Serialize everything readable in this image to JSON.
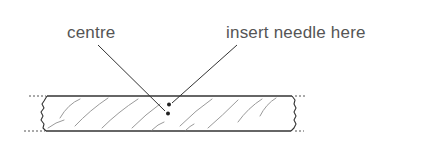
{
  "diagram": {
    "labels": {
      "centre": "centre",
      "insert_needle": "insert needle here"
    },
    "colors": {
      "line": "#333333",
      "hatch": "#9a9a9a",
      "text": "#555555",
      "background": "#ffffff"
    }
  }
}
